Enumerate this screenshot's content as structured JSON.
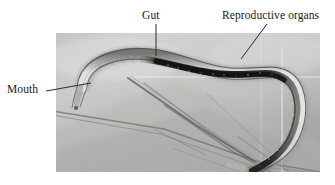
{
  "figure": {
    "type": "annotated-micrograph",
    "background_color": "#ffffff",
    "photo": {
      "frame_color": "#c9c9c7",
      "x": 56,
      "y": 33,
      "width": 264,
      "height": 139,
      "description": "light-grey photomicrograph of a curved nematode lying across fine fibres"
    },
    "annotations": [
      {
        "id": "gut",
        "label": "Gut",
        "text_color": "#1a1a1a",
        "leader": {
          "shape": "vertical",
          "x1": 156,
          "y1": 24,
          "x2": 156,
          "y2": 56
        }
      },
      {
        "id": "reproductive-organs",
        "label": "Reproductive organs",
        "text_color": "#1a1a1a",
        "leader": {
          "shape": "diagonal",
          "x1": 267,
          "y1": 24,
          "x2": 241,
          "y2": 59
        }
      },
      {
        "id": "mouth",
        "label": "Mouth",
        "text_color": "#1a1a1a",
        "leader": {
          "shape": "diagonal",
          "x1": 46,
          "y1": 91,
          "x2": 91,
          "y2": 83
        }
      }
    ],
    "leader_color": "#2b2b2b"
  }
}
